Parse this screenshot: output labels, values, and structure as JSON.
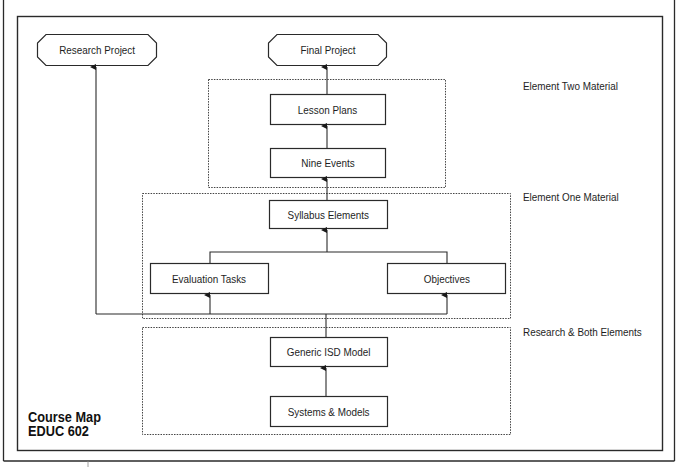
{
  "title": {
    "line1": "Course Map",
    "line2": "EDUC 602"
  },
  "sections": {
    "element_two": "Element Two Material",
    "element_one": "Element One Material",
    "research_both": "Research & Both Elements"
  },
  "nodes": {
    "research_project": "Research Project",
    "final_project": "Final Project",
    "lesson_plans": "Lesson Plans",
    "nine_events": "Nine Events",
    "syllabus_elements": "Syllabus Elements",
    "evaluation_tasks": "Evaluation Tasks",
    "objectives": "Objectives",
    "generic_isd_model": "Generic ISD Model",
    "systems_models": "Systems & Models"
  },
  "colors": {
    "line": "#2a2a2a",
    "background": "#ffffff"
  }
}
